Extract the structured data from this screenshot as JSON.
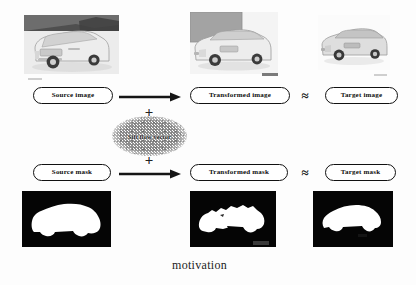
{
  "figure": {
    "caption": "motivation",
    "background_color": "#fdfdfd"
  },
  "rows": {
    "image_row": {
      "source_label": "Source image",
      "transformed_label": "Transformed image",
      "target_label": "Target image",
      "approx_symbol": "≈",
      "plus_symbol": "+"
    },
    "mask_row": {
      "source_label": "Source mask",
      "transformed_label": "Transformed mask",
      "target_label": "Target mask",
      "approx_symbol": "≈",
      "plus_symbol": "+"
    }
  },
  "operator": {
    "flow_label": "Sift flow vector"
  },
  "panels": {
    "source_image": {
      "name": "source-image-photo",
      "description": "white SUV rear three-quarter view with dark treeline band",
      "body_color": "#e9e9e9",
      "background_color": "#f2f2f2",
      "band_color": "#5d5d5d"
    },
    "transformed_image": {
      "name": "transformed-image-photo",
      "description": "white SUV front three-quarter view with grey block upper left",
      "body_color": "#e6e6e6",
      "background_color": "#f3f3f3",
      "band_color": "#9a9a9a"
    },
    "target_image": {
      "name": "target-image-photo",
      "description": "silver SUV front three-quarter view on white background",
      "body_color": "#d9d9d9",
      "background_color": "#fbfbfb"
    },
    "source_mask": {
      "name": "source-mask-image",
      "description": "binary mask, white car silhouette on black",
      "foreground_color": "#ffffff",
      "background_color": "#050505"
    },
    "transformed_mask": {
      "name": "transformed-mask-image",
      "description": "warped binary mask with jagged edges on black",
      "foreground_color": "#ffffff",
      "background_color": "#050505"
    },
    "target_mask": {
      "name": "target-mask-image",
      "description": "binary mask, white car silhouette on black",
      "foreground_color": "#ffffff",
      "background_color": "#050505"
    }
  }
}
